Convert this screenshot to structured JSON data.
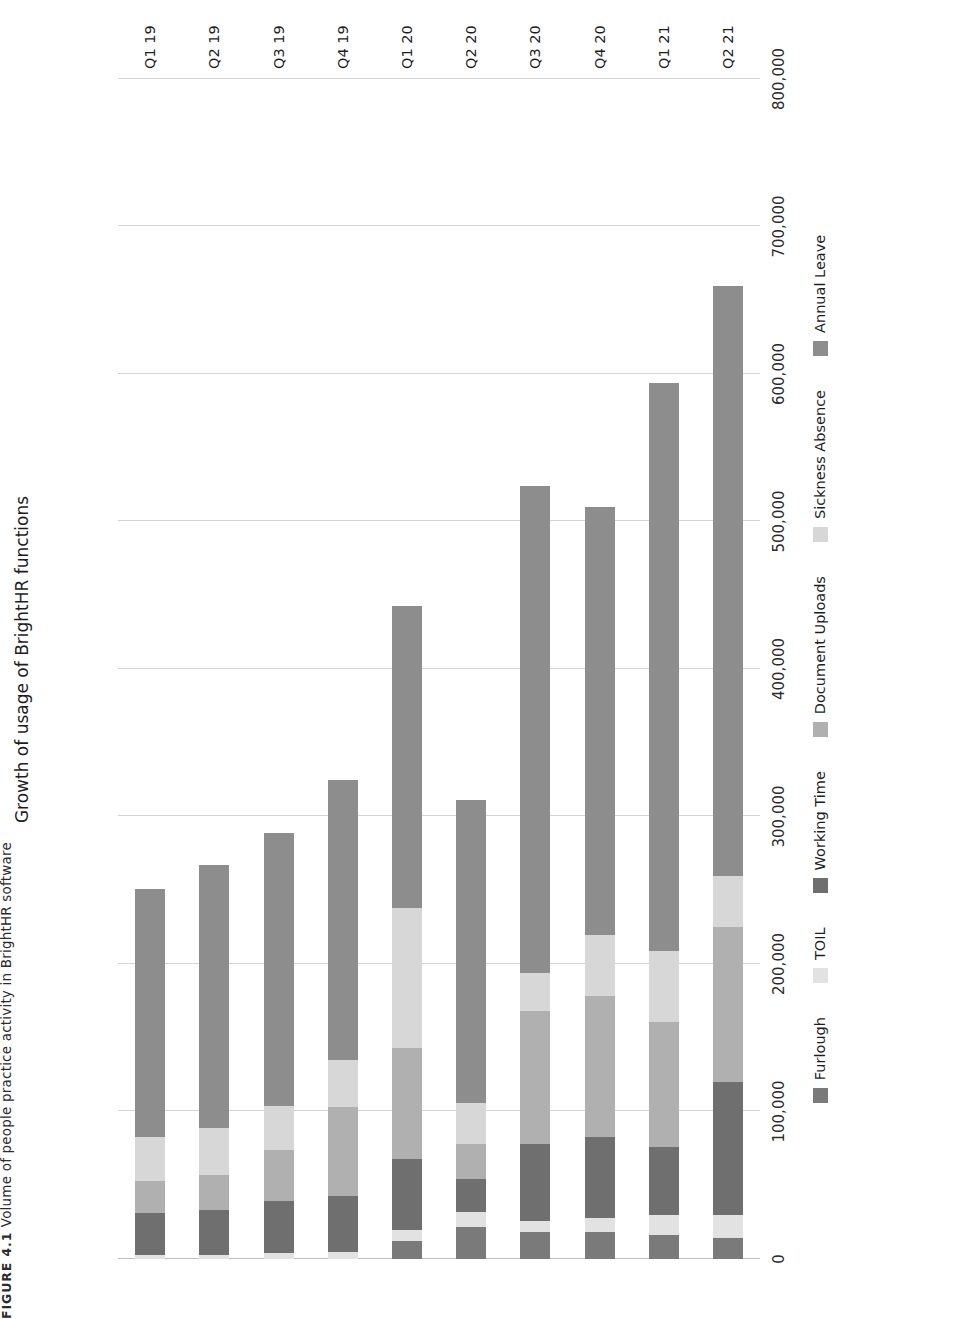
{
  "figure_caption": {
    "label": "FIGURE 4.1",
    "text": "Volume of people practice activity in BrightHR software"
  },
  "chart_data": {
    "type": "bar",
    "orientation": "horizontal-stacked",
    "title": "Growth of usage of BrightHR functions",
    "xlabel": "",
    "ylabel": "",
    "grid": true,
    "legend_position": "bottom",
    "xlim": [
      0,
      800000
    ],
    "xticks": [
      0,
      100000,
      200000,
      300000,
      400000,
      500000,
      600000,
      700000,
      800000
    ],
    "xtick_labels": [
      "0",
      "100,000",
      "200,000",
      "300,000",
      "400,000",
      "500,000",
      "600,000",
      "700,000",
      "800,000"
    ],
    "categories": [
      "Q1 19",
      "Q2 19",
      "Q3 19",
      "Q4 19",
      "Q1 20",
      "Q2 20",
      "Q3 20",
      "Q4 20",
      "Q1 21",
      "Q2 21"
    ],
    "series": [
      {
        "name": "Annual Leave",
        "color": "#8d8d8d",
        "values": [
          168000,
          178000,
          185000,
          190000,
          205000,
          205000,
          330000,
          290000,
          385000,
          400000
        ]
      },
      {
        "name": "Sickness Absence",
        "color": "#d7d7d7",
        "values": [
          30000,
          32000,
          30000,
          32000,
          95000,
          28000,
          26000,
          42000,
          48000,
          35000
        ]
      },
      {
        "name": "Document Uploads",
        "color": "#b0b0b0",
        "values": [
          22000,
          24000,
          35000,
          60000,
          75000,
          24000,
          90000,
          95000,
          85000,
          105000
        ]
      },
      {
        "name": "Working Time",
        "color": "#6f6f6f",
        "values": [
          28000,
          30000,
          35000,
          38000,
          48000,
          22000,
          52000,
          55000,
          46000,
          90000
        ]
      },
      {
        "name": "TOIL",
        "color": "#e2e2e2",
        "values": [
          3000,
          3000,
          4000,
          5000,
          8000,
          10000,
          8000,
          10000,
          14000,
          16000
        ]
      },
      {
        "name": "Furlough",
        "color": "#7a7a7a",
        "values": [
          0,
          0,
          0,
          0,
          12000,
          22000,
          18000,
          18000,
          16000,
          14000
        ]
      }
    ],
    "totals": [
      251000,
      267000,
      289000,
      325000,
      443000,
      311000,
      524000,
      510000,
      594000,
      660000
    ]
  },
  "legend": [
    {
      "label": "Annual Leave",
      "color": "#8d8d8d"
    },
    {
      "label": "Sickness Absence",
      "color": "#d7d7d7"
    },
    {
      "label": "Document Uploads",
      "color": "#b0b0b0"
    },
    {
      "label": "Working Time",
      "color": "#6f6f6f"
    },
    {
      "label": "TOIL",
      "color": "#e2e2e2"
    },
    {
      "label": "Furlough",
      "color": "#7a7a7a"
    }
  ]
}
